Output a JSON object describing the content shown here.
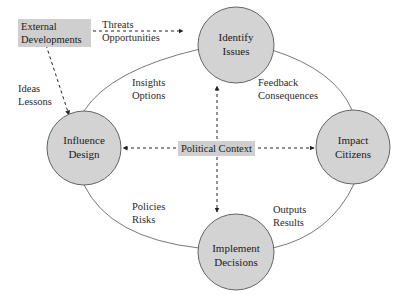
{
  "diagram": {
    "colors": {
      "node_fill": "#d3d3d3",
      "node_stroke": "#555555",
      "box_fill": "#cfcfcf",
      "line": "#444444"
    },
    "nodes": [
      {
        "id": "identify",
        "line1": "Identify",
        "line2": "Issues"
      },
      {
        "id": "influence",
        "line1": "Influence",
        "line2": "Design"
      },
      {
        "id": "impact",
        "line1": "Impact",
        "line2": "Citizens"
      },
      {
        "id": "implement",
        "line1": "Implement",
        "line2": "Decisions"
      }
    ],
    "boxes": {
      "external": {
        "line1": "External",
        "line2": "Developments"
      },
      "political": {
        "label": "Political Context"
      }
    },
    "edge_labels": {
      "threats": {
        "line1": "Threats",
        "line2": "Opportunities"
      },
      "ideas": {
        "line1": "Ideas",
        "line2": "Lessons"
      },
      "insights": {
        "line1": "Insights",
        "line2": "Options"
      },
      "feedback": {
        "line1": "Feedback",
        "line2": "Consequences"
      },
      "policies": {
        "line1": "Policies",
        "line2": "Risks"
      },
      "outputs": {
        "line1": "Outputs",
        "line2": "Results"
      }
    }
  }
}
